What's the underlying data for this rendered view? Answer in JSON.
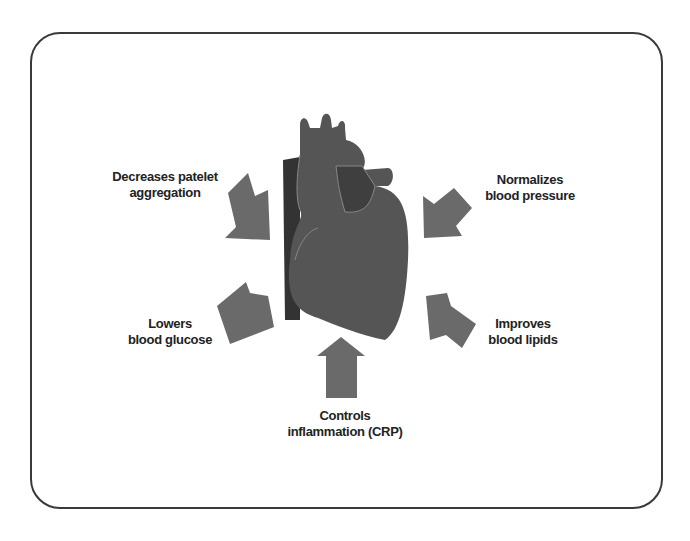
{
  "diagram": {
    "center": "heart",
    "colors": {
      "heart": "#555555",
      "vessel": "#3a3a3a",
      "arrow": "#6a6a6a",
      "frame": "#3a3a3a"
    },
    "labels": {
      "top_left": [
        "Decreases patelet",
        "aggregation"
      ],
      "top_right": [
        "Normalizes",
        "blood pressure"
      ],
      "bottom_left": [
        "Lowers",
        "blood glucose"
      ],
      "bottom_right": [
        "Improves",
        "blood lipids"
      ],
      "bottom": [
        "Controls",
        "inflammation (CRP)"
      ]
    }
  }
}
